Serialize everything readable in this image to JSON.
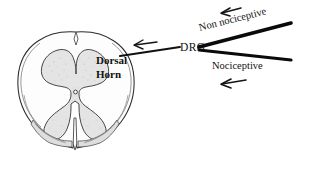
{
  "figure": {
    "kind": "spinal-cord-cross-section-diagram",
    "width": 309,
    "height": 171,
    "background_color": "#ffffff",
    "ink_color": "#111111",
    "grey_matter_fill": "#e3e3e3",
    "white_matter_fill": "#fcfcfc",
    "root_fill": "#dcdcdc"
  },
  "labels": {
    "drg": "DRG",
    "dorsal_horn_line1": "Dorsal",
    "dorsal_horn_line2": "Horn",
    "non_nociceptive": "Non nociceptive",
    "nociceptive": "Nociceptive"
  },
  "arrows": [
    {
      "name": "arrow-non-nociceptive-input",
      "direction": "left",
      "x1": 241,
      "y1": 8,
      "x2": 221,
      "y2": 13
    },
    {
      "name": "arrow-nociceptive-input",
      "direction": "left",
      "x1": 246,
      "y1": 80,
      "x2": 221,
      "y2": 84
    },
    {
      "name": "arrow-dorsal-horn-entry",
      "direction": "left",
      "x1": 156,
      "y1": 43,
      "x2": 134,
      "y2": 45
    }
  ],
  "nerve_lines": [
    {
      "name": "dorsal-root-proximal",
      "x1": 120,
      "y1": 56,
      "x2": 180,
      "y2": 47,
      "thickness": 2.0
    },
    {
      "name": "non-nociceptive-afferent",
      "x1": 199,
      "y1": 47,
      "x2": 291,
      "y2": 23,
      "thickness": 3.6
    },
    {
      "name": "nociceptive-afferent",
      "x1": 199,
      "y1": 50,
      "x2": 291,
      "y2": 60,
      "thickness": 3.0
    }
  ]
}
